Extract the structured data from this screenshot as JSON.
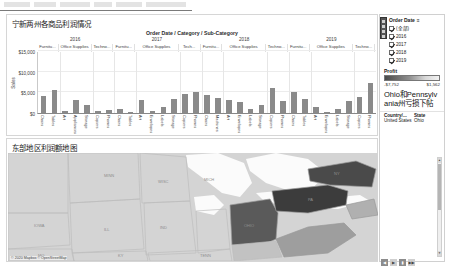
{
  "window": {
    "toolbar_present": true
  },
  "chart_panel": {
    "title": "宁新两州各商品利润情况",
    "header_label": "Order Date / Category / Sub-Category",
    "yaxis_title": "Sales"
  },
  "map_panel": {
    "title": "东部地区利润额地图",
    "attribution": "© 2020 Mapbox © OpenStreetMap"
  },
  "filter": {
    "title": "Order Date",
    "title_suffix": "≡",
    "items": [
      {
        "label": "(全部)",
        "checked": true
      },
      {
        "label": "2016",
        "checked": true
      },
      {
        "label": "2017",
        "checked": true
      },
      {
        "label": "2018",
        "checked": true
      },
      {
        "label": "2019",
        "checked": true
      }
    ]
  },
  "profit_legend": {
    "title": "Profit",
    "min_label": "-$7,752",
    "max_label": "$1,562",
    "color_low": "#4a4a4a",
    "color_high": "#f2f2f2"
  },
  "note": {
    "text": "Ohio和Pennsylvania州亏损下帖"
  },
  "country_state_table": {
    "headers": [
      "Country/...",
      "State"
    ],
    "rows": [
      {
        "country": "United States",
        "state": "Ohio"
      }
    ]
  },
  "bottom_nav": {
    "buttons": [
      "◀",
      "▶",
      "▮",
      "▶▶"
    ]
  },
  "chart_data": {
    "type": "bar",
    "title": "宁新两州各商品利润情况",
    "xlabel": "Order Date / Category / Sub-Category",
    "ylabel": "Sales",
    "ylim": [
      0,
      15000
    ],
    "yticks": [
      0,
      5000,
      10000,
      15000
    ],
    "ytick_labels": [
      "$0",
      "$5,000",
      "$10,000",
      "$15,000"
    ],
    "grid": true,
    "legend": "none",
    "years": [
      "2016",
      "2017",
      "2018",
      "2019"
    ],
    "categories_per_year": [
      "Furnitu...",
      "Office Supplies",
      "Techno...",
      "Furnitu...",
      "Office Supplies",
      "Tech...",
      "Furnitu...",
      "Office Supplies",
      "Techno...",
      "Furnitu...",
      "Office Supplies",
      "Techno..."
    ],
    "groups": [
      {
        "year": "2016",
        "category": "Furnitu...",
        "subcategories": [
          "Chairs",
          "Tables"
        ],
        "values": [
          4050,
          5600
        ]
      },
      {
        "year": "2016",
        "category": "Office Supplies",
        "subcategories": [
          "Art",
          "Appliances",
          "Storage"
        ],
        "values": [
          450,
          3100,
          2050
        ]
      },
      {
        "year": "2016",
        "category": "Techno...",
        "subcategories": [
          "Copiers",
          "Phones"
        ],
        "values": [
          500,
          700
        ]
      },
      {
        "year": "2017",
        "category": "Furnitu...",
        "subcategories": [
          "Chairs",
          "Tables"
        ],
        "values": [
          900,
          300
        ]
      },
      {
        "year": "2017",
        "category": "Office Supplies",
        "subcategories": [
          "Art",
          "Envelopes",
          "Labels",
          "Storage"
        ],
        "values": [
          3100,
          600,
          1500,
          3500
        ]
      },
      {
        "year": "2017",
        "category": "Tech...",
        "subcategories": [
          "Copiers",
          "Phones"
        ],
        "values": [
          4700,
          5100
        ]
      },
      {
        "year": "2018",
        "category": "Furnitu...",
        "subcategories": [
          "Chairs",
          "Machines"
        ],
        "values": [
          4400,
          3700
        ]
      },
      {
        "year": "2018",
        "category": "Office Supplies",
        "subcategories": [
          "Art",
          "Envelopes",
          "Labels",
          "Storage"
        ],
        "values": [
          3200,
          2650,
          900,
          1950
        ]
      },
      {
        "year": "2018",
        "category": "Techno...",
        "subcategories": [
          "Copiers",
          "Phones"
        ],
        "values": [
          6100,
          3000
        ]
      },
      {
        "year": "2019",
        "category": "Furnitu...",
        "subcategories": [
          "Chairs",
          "Tables"
        ],
        "values": [
          5200,
          3400
        ]
      },
      {
        "year": "2019",
        "category": "Office Supplies",
        "subcategories": [
          "Art",
          "Envelopes",
          "Labels",
          "Storage"
        ],
        "values": [
          1500,
          300,
          900,
          3000
        ]
      },
      {
        "year": "2019",
        "category": "Techno...",
        "subcategories": [
          "Copiers",
          "Phones"
        ],
        "values": [
          3800,
          7300
        ]
      }
    ]
  },
  "map_data": {
    "type": "choropleth",
    "highlighted_states": [
      "Ohio",
      "Pennsylvania"
    ],
    "state_labels": [
      "MINN",
      "WISC",
      "MICH",
      "IOWA",
      "ILL",
      "IND",
      "OHIO",
      "KY",
      "MO",
      "TENN",
      "PA",
      "NY",
      "W VA",
      "VA"
    ]
  }
}
